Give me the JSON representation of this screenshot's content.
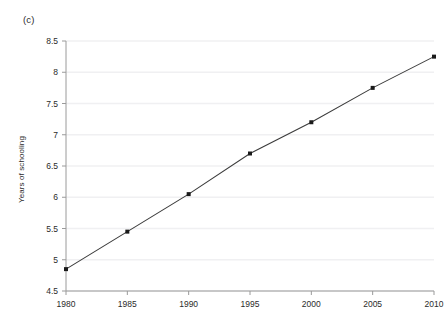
{
  "panel": {
    "label": "(c)"
  },
  "chart_data": {
    "type": "line",
    "title": "",
    "subtitle": "",
    "xlabel": "",
    "ylabel": "Years of schooling",
    "x": [
      1980,
      1985,
      1990,
      1995,
      2000,
      2005,
      2010
    ],
    "values": [
      4.85,
      5.45,
      6.05,
      6.7,
      7.2,
      7.75,
      8.25
    ],
    "xtick_labels": [
      "1980",
      "1985",
      "1990",
      "1995",
      "2000",
      "2005",
      "2010"
    ],
    "ytick_labels": [
      "4.5",
      "5",
      "5.5",
      "6",
      "6.5",
      "7",
      "7.5",
      "8",
      "8.5"
    ],
    "ytick_values": [
      4.5,
      5,
      5.5,
      6,
      6.5,
      7,
      7.5,
      8,
      8.5
    ],
    "xlim": [
      1980,
      2010
    ],
    "ylim": [
      4.5,
      8.5
    ],
    "grid": "horizontal",
    "legend": "none",
    "marker": "filled-square",
    "line_color": "#3c3c3c",
    "marker_color": "#1a1a1a",
    "grid_color": "#f0f0f2",
    "axis_color": "#9a9a9a",
    "background": "#ffffff"
  }
}
